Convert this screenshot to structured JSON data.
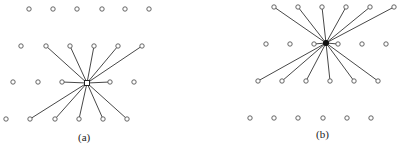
{
  "panels": [
    {
      "id": "a",
      "label": "(a)",
      "label_pos": [
        78,
        131
      ],
      "center": [
        87,
        83
      ],
      "center_style": "square",
      "rows": [
        {
          "y": 9,
          "xs": [
            29,
            53,
            77,
            102,
            125,
            149
          ]
        },
        {
          "y": 46,
          "xs": [
            21,
            46,
            70,
            94,
            118,
            142
          ]
        },
        {
          "y": 82,
          "xs": [
            13,
            38,
            62,
            110,
            134
          ]
        },
        {
          "y": 119,
          "xs": [
            6,
            30,
            55,
            79,
            103,
            127
          ]
        }
      ],
      "edges_to": [
        [
          46,
          46
        ],
        [
          70,
          46
        ],
        [
          94,
          46
        ],
        [
          118,
          46
        ],
        [
          142,
          46
        ],
        [
          62,
          82
        ],
        [
          110,
          82
        ],
        [
          30,
          119
        ],
        [
          55,
          119
        ],
        [
          79,
          119
        ],
        [
          103,
          119
        ],
        [
          127,
          119
        ]
      ]
    },
    {
      "id": "b",
      "label": "(b)",
      "label_pos": [
        316,
        128
      ],
      "center": [
        326,
        43
      ],
      "center_style": "filled",
      "rows": [
        {
          "y": 7,
          "xs": [
            274,
            298,
            322,
            346,
            370,
            394
          ]
        },
        {
          "y": 44,
          "xs": [
            266,
            290,
            314,
            338,
            362,
            386
          ]
        },
        {
          "y": 81,
          "xs": [
            258,
            282,
            306,
            330,
            354,
            378
          ]
        },
        {
          "y": 118,
          "xs": [
            250,
            274,
            298,
            323,
            347,
            371
          ]
        }
      ],
      "edges_to": [
        [
          274,
          7
        ],
        [
          298,
          7
        ],
        [
          322,
          7
        ],
        [
          346,
          7
        ],
        [
          370,
          7
        ],
        [
          394,
          7
        ],
        [
          314,
          44
        ],
        [
          338,
          44
        ],
        [
          258,
          81
        ],
        [
          282,
          81
        ],
        [
          306,
          81
        ],
        [
          330,
          81
        ],
        [
          354,
          81
        ],
        [
          378,
          81
        ]
      ]
    }
  ]
}
